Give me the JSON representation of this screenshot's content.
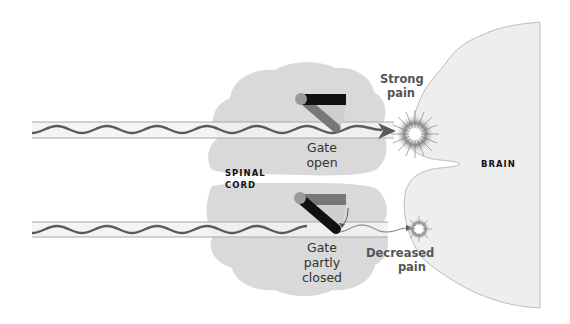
{
  "diagram": {
    "labels": {
      "gate_open": [
        "Gate",
        "open"
      ],
      "gate_partly_closed": [
        "Gate",
        "partly",
        "closed"
      ],
      "spinal_cord": [
        "SPINAL",
        "CORD"
      ],
      "brain": "BRAIN",
      "strong_pain": [
        "Strong",
        "pain"
      ],
      "decreased_pain": [
        "Decreased",
        "pain"
      ]
    },
    "colors": {
      "spinal_cord_fill": "#d9d9d9",
      "brain_fill": "#eeeeee",
      "brain_outline": "#bdbdbd",
      "nerve_tube_fill": "#f2f2f2",
      "nerve_tube_border": "#a8a8a8",
      "nerve_signal": "#5a5a5a",
      "gate_bar_dark": "#111111",
      "gate_bar_grey": "#777777",
      "pivot": "#9a9a9a",
      "text": "#333333"
    },
    "pathways": [
      {
        "name": "upper-nerve-fiber",
        "gate_state": "open",
        "pain_result": "strong"
      },
      {
        "name": "lower-nerve-fiber",
        "gate_state": "partly closed",
        "pain_result": "decreased"
      }
    ]
  }
}
